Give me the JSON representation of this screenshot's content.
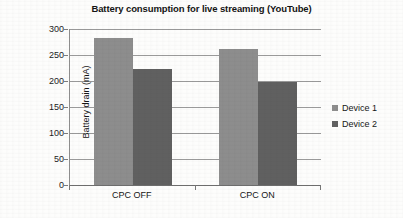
{
  "chart_data": {
    "type": "bar",
    "title": "Battery consumption for live streaming (YouTube)",
    "xlabel": "",
    "ylabel": "Battery drain (mA)",
    "categories": [
      "CPC OFF",
      "CPC ON"
    ],
    "series": [
      {
        "name": "Device 1",
        "values": [
          283,
          262
        ],
        "color": "#8d8d8d"
      },
      {
        "name": "Device 2",
        "values": [
          223,
          198
        ],
        "color": "#606060"
      }
    ],
    "ylim": [
      0,
      300
    ],
    "ytick_step": 50,
    "yticks": [
      0,
      50,
      100,
      150,
      200,
      250,
      300
    ],
    "ytick_labels": [
      "0",
      "50",
      "100",
      "150",
      "200",
      "250",
      "300"
    ],
    "grid": true,
    "legend_position": "right"
  },
  "legend": {
    "entries": [
      {
        "label": "Device 1",
        "color": "#8d8d8d"
      },
      {
        "label": "Device 2",
        "color": "#606060"
      }
    ]
  }
}
